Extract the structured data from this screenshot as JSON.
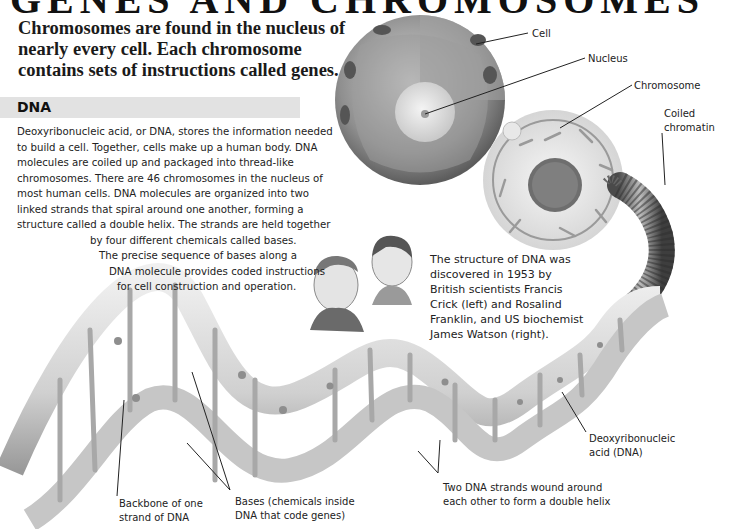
{
  "title": {
    "cut_off_text": "GENES AND CHROMOSOMES",
    "intro": "Chromosomes are found in the nucleus of nearly every cell. Each chromosome contains sets of instructions called genes."
  },
  "dna_section": {
    "heading": "DNA",
    "lines": [
      "Deoxyribonucleic acid, or DNA, stores the information needed",
      "to build a cell. Together, cells make up a human body. DNA",
      "molecules are coiled up and packaged into thread-like",
      "chromosomes. There are 46 chromosomes in the nucleus of",
      "most human cells. DNA molecules are organized into two",
      "linked strands that spiral around one another, forming a",
      "structure called a double helix. The strands are held together",
      "by four different chemicals called bases.",
      "The precise sequence of bases along a",
      "DNA molecule provides coded instructions",
      "for cell construction and operation."
    ]
  },
  "discovery_caption": {
    "lines": [
      "The structure of DNA was",
      "discovered in 1953 by",
      "British scientists Francis",
      "Crick (left) and Rosalind",
      "Franklin, and US biochemist",
      "James Watson (right)."
    ]
  },
  "labels": {
    "cell": "Cell",
    "nucleus": "Nucleus",
    "chromosome": "Chromosome",
    "coiled_chromatin": [
      "Coiled",
      "chromatin"
    ],
    "dna": [
      "Deoxyribonucleic",
      "acid (DNA)"
    ],
    "two_strands": [
      "Two DNA strands wound around",
      "each other to form a double helix"
    ],
    "bases": [
      "Bases (chemicals inside",
      "DNA that code genes)"
    ],
    "backbone": [
      "Backbone of one",
      "strand of DNA"
    ]
  },
  "colors": {
    "heading_band": "#e2e2e2",
    "text": "#222222",
    "illustration_gray": "#b8b8b8",
    "leader_line": "#222222"
  }
}
